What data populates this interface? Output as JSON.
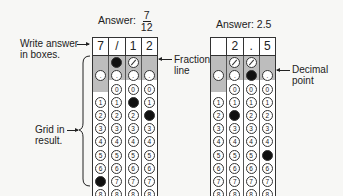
{
  "left": {
    "title_prefix": "Answer:",
    "fraction": {
      "numerator": "7",
      "denominator": "12"
    },
    "boxes": [
      "7",
      "/",
      "1",
      "2"
    ],
    "fills": {
      "col1": "7",
      "col2": "/",
      "col3": "1",
      "col4": "2"
    }
  },
  "right": {
    "title": "Answer: 2.5",
    "boxes": [
      "",
      "2",
      ".",
      "5"
    ],
    "fills": {
      "col1": "",
      "col2": "2",
      "col3": ".",
      "col4": "5"
    }
  },
  "annotations": {
    "write_answer": "Write answer",
    "write_answer_2": "in boxes.",
    "grid_in": "Grid in",
    "grid_in_2": "result.",
    "fraction_line": "Fraction",
    "fraction_line_2": "line",
    "decimal_point": "Decimal",
    "decimal_point_2": "point"
  },
  "digits": [
    "0",
    "1",
    "2",
    "3",
    "4",
    "5",
    "6",
    "7",
    "8",
    "9"
  ],
  "colors": {
    "shade": "#bdbdbd",
    "fill": "#111111",
    "border": "#333333"
  }
}
